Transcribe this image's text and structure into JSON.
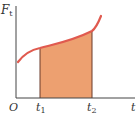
{
  "diagram": {
    "y_axis_label": "F",
    "y_axis_subscript": "t",
    "x_axis_label": "t",
    "origin_label": "O",
    "t1_label": "t",
    "t1_subscript": "1",
    "t2_label": "t",
    "t2_subscript": "2",
    "colors": {
      "curve": "#e05a4f",
      "fill": "#eda070",
      "axis": "#444444"
    }
  }
}
